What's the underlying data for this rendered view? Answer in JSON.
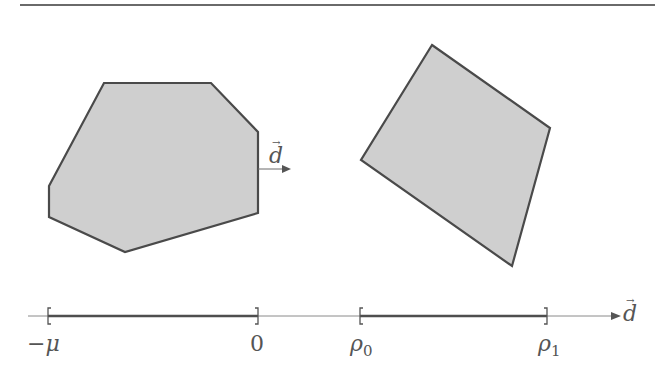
{
  "figure": {
    "colors": {
      "rule": "#6a6a6a",
      "polygon_fill": "#cfcfcf",
      "polygon_stroke": "#4a4a4a",
      "axis": "#8a8a8a",
      "interval": "#4e4e4e",
      "text": "#555555"
    },
    "polygon_a": {
      "name": "left-polygon",
      "points": "104,83 211,83 258,132 258,213 125,252 49,217 49,186"
    },
    "polygon_b": {
      "name": "right-quadrilateral",
      "points": "432,45 550,128 512,266 361,160"
    },
    "direction_vector": {
      "label": "d",
      "arrow_glyph": "→"
    },
    "axis": {
      "label": "d",
      "arrow_glyph": "→",
      "intervals": [
        {
          "start_label": "−μ",
          "end_label": "0"
        },
        {
          "start_label": "ρ",
          "start_sub": "0",
          "end_label": "ρ",
          "end_sub": "1"
        }
      ]
    }
  }
}
